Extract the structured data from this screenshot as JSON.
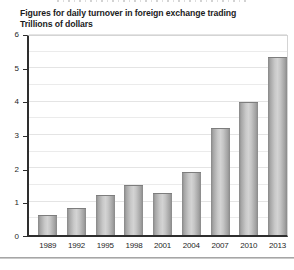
{
  "chart_data": {
    "type": "bar",
    "title": "Figures for daily turnover in foreign exchange trading",
    "subtitle": "Trillions of dollars",
    "categories": [
      "1989",
      "1992",
      "1995",
      "1998",
      "2001",
      "2004",
      "2007",
      "2010",
      "2013"
    ],
    "values": [
      0.6,
      0.8,
      1.2,
      1.5,
      1.25,
      1.9,
      3.2,
      4.0,
      5.35
    ],
    "xlabel": "",
    "ylabel": "Trillions of dollars",
    "ylim": [
      0,
      6
    ],
    "yticks": [
      "0",
      "1",
      "2",
      "3",
      "4",
      "5",
      "6"
    ],
    "gridline_step": 0.5,
    "grid": true,
    "legend": false
  },
  "colors": {
    "bar_edge": "#878787",
    "bar_center": "#d3d3d3",
    "axis": "#2e2e2e",
    "gridline": "#ebebeb",
    "plot_border": "#d4d4d4",
    "text": "#1c1c1c",
    "divider": "#949494"
  }
}
